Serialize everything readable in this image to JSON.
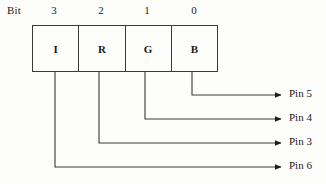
{
  "diagram": {
    "bit_caption": "Bit",
    "register": {
      "bits": [
        {
          "number": "3",
          "name": "I",
          "pin": "Pin 6"
        },
        {
          "number": "2",
          "name": "R",
          "pin": "Pin 3"
        },
        {
          "number": "1",
          "name": "G",
          "pin": "Pin 4"
        },
        {
          "number": "0",
          "name": "B",
          "pin": "Pin 5"
        }
      ]
    },
    "pins": [
      {
        "label": "Pin 5",
        "from_bit": "0",
        "from_name": "B"
      },
      {
        "label": "Pin 4",
        "from_bit": "1",
        "from_name": "G"
      },
      {
        "label": "Pin 3",
        "from_bit": "2",
        "from_name": "R"
      },
      {
        "label": "Pin 6",
        "from_bit": "3",
        "from_name": "I"
      }
    ],
    "colors": {
      "stroke": "#3a3a3a",
      "text": "#1a1a1a",
      "background": "#fdfdfc"
    }
  }
}
